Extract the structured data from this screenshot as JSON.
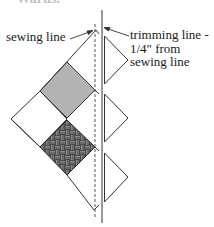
{
  "diagram": {
    "top_fragment": "• • Wards.",
    "labels": {
      "sewing_line": "sewing line",
      "trimming_line": [
        "trimming line -",
        "1/4\" from",
        "sewing line"
      ]
    },
    "colors": {
      "stroke": "#333333",
      "gray_fill": "#b3b3b3",
      "pattern_fill": "#4a4a4a",
      "pattern_stripe": "#9a9a9a",
      "white_fill": "#ffffff"
    },
    "elements": {
      "sewing_line_style": "dashed",
      "trimming_line_style": "solid",
      "diamonds": [
        {
          "name": "gray-square",
          "fill": "gray"
        },
        {
          "name": "left-white-square",
          "fill": "white"
        },
        {
          "name": "patterned-square",
          "fill": "basket-weave"
        },
        {
          "name": "upper-white-triangle",
          "fill": "white"
        },
        {
          "name": "lower-white-triangle",
          "fill": "white"
        }
      ],
      "trimmed_triangles": 3
    }
  }
}
